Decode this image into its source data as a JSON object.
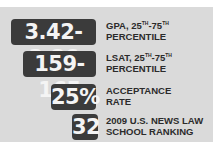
{
  "colors": {
    "panel_background": "#dadada",
    "badge_background": "#3b3b3b",
    "badge_text": "#f4f4f4",
    "label_text": "#2b2b2b"
  },
  "stats": [
    {
      "value": "3.42-3.86",
      "label_line1_prefix": "GPA, 25",
      "label_line1_sup1": "TH",
      "label_line1_mid": "-75",
      "label_line1_sup2": "TH",
      "label_line2": "PERCENTILE"
    },
    {
      "value": "159-165",
      "label_line1_prefix": "LSAT, 25",
      "label_line1_sup1": "TH",
      "label_line1_mid": "-75",
      "label_line1_sup2": "TH",
      "label_line2": "PERCENTILE"
    },
    {
      "value": "25%",
      "label_line1": "ACCEPTANCE",
      "label_line2": "RATE"
    },
    {
      "value": "32",
      "label_line1": "2009 U.S. NEWS LAW",
      "label_line2": "SCHOOL RANKING"
    }
  ]
}
